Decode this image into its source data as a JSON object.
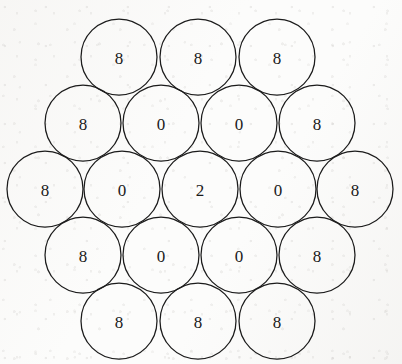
{
  "figure": {
    "name": "hexagonal-circle-packing",
    "width": 402,
    "height": 364,
    "background_color": "#fcfcfb",
    "stroke_color": "#1b1b1b",
    "label_color": "#1a1a1a",
    "circle_radius": 38,
    "total_circles": 19
  },
  "chart_data": {
    "type": "diagram",
    "title": "",
    "xlabel": "",
    "ylabel": "",
    "layout": "hexagonal-packing",
    "rows": [
      3,
      4,
      5,
      4,
      3
    ],
    "values_by_row": [
      [
        "8",
        "8",
        "8"
      ],
      [
        "8",
        "0",
        "0",
        "8"
      ],
      [
        "8",
        "0",
        "2",
        "0",
        "8"
      ],
      [
        "8",
        "0",
        "0",
        "8"
      ],
      [
        "8",
        "8",
        "8"
      ]
    ],
    "values_flat": [
      "8",
      "8",
      "8",
      "8",
      "0",
      "0",
      "8",
      "8",
      "0",
      "2",
      "0",
      "8",
      "8",
      "0",
      "0",
      "8",
      "8",
      "8",
      "8"
    ],
    "center_value": "2"
  },
  "circles": [
    {
      "id": "r1c1",
      "row": 1,
      "col": 1,
      "cx": 119,
      "cy": 57,
      "r": 38,
      "value": "8"
    },
    {
      "id": "r1c2",
      "row": 1,
      "col": 2,
      "cx": 198,
      "cy": 57,
      "r": 38,
      "value": "8"
    },
    {
      "id": "r1c3",
      "row": 1,
      "col": 3,
      "cx": 277,
      "cy": 57,
      "r": 38,
      "value": "8"
    },
    {
      "id": "r2c1",
      "row": 2,
      "col": 1,
      "cx": 83,
      "cy": 123,
      "r": 38,
      "value": "8"
    },
    {
      "id": "r2c2",
      "row": 2,
      "col": 2,
      "cx": 161,
      "cy": 123,
      "r": 38,
      "value": "0"
    },
    {
      "id": "r2c3",
      "row": 2,
      "col": 3,
      "cx": 239,
      "cy": 123,
      "r": 38,
      "value": "0"
    },
    {
      "id": "r2c4",
      "row": 2,
      "col": 4,
      "cx": 317,
      "cy": 123,
      "r": 38,
      "value": "8"
    },
    {
      "id": "r3c1",
      "row": 3,
      "col": 1,
      "cx": 45,
      "cy": 189,
      "r": 38,
      "value": "8"
    },
    {
      "id": "r3c2",
      "row": 3,
      "col": 2,
      "cx": 122,
      "cy": 189,
      "r": 38,
      "value": "0"
    },
    {
      "id": "r3c3",
      "row": 3,
      "col": 3,
      "cx": 200,
      "cy": 189,
      "r": 38,
      "value": "2"
    },
    {
      "id": "r3c4",
      "row": 3,
      "col": 4,
      "cx": 278,
      "cy": 189,
      "r": 38,
      "value": "0"
    },
    {
      "id": "r3c5",
      "row": 3,
      "col": 5,
      "cx": 355,
      "cy": 189,
      "r": 38,
      "value": "8"
    },
    {
      "id": "r4c1",
      "row": 4,
      "col": 1,
      "cx": 83,
      "cy": 255,
      "r": 38,
      "value": "8"
    },
    {
      "id": "r4c2",
      "row": 4,
      "col": 2,
      "cx": 161,
      "cy": 255,
      "r": 38,
      "value": "0"
    },
    {
      "id": "r4c3",
      "row": 4,
      "col": 3,
      "cx": 239,
      "cy": 255,
      "r": 38,
      "value": "0"
    },
    {
      "id": "r4c4",
      "row": 4,
      "col": 4,
      "cx": 317,
      "cy": 255,
      "r": 38,
      "value": "8"
    },
    {
      "id": "r5c1",
      "row": 5,
      "col": 1,
      "cx": 119,
      "cy": 321,
      "r": 38,
      "value": "8"
    },
    {
      "id": "r5c2",
      "row": 5,
      "col": 2,
      "cx": 198,
      "cy": 321,
      "r": 38,
      "value": "8"
    },
    {
      "id": "r5c3",
      "row": 5,
      "col": 3,
      "cx": 277,
      "cy": 321,
      "r": 38,
      "value": "8"
    }
  ]
}
